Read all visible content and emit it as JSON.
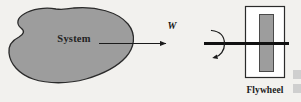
{
  "figure": {
    "kind": "engineering-diagram",
    "background_color": "#f2f1ee",
    "ink_color": "#1b1b1b"
  },
  "system": {
    "label": "System",
    "shape": "irregular-blob",
    "fill_color": "#9d9d9d",
    "stroke_color": "#2b2b2b"
  },
  "work_arrow": {
    "label": "W",
    "meaning": "work transfer",
    "direction": "left-to-right",
    "color": "#1b1b1b"
  },
  "shaft": {
    "label": "",
    "color": "#111111",
    "description": "thick rotating shaft"
  },
  "rotation": {
    "label": "",
    "direction": "clockwise",
    "color": "#1b1b1b",
    "description": "curved rotation arrow around shaft"
  },
  "flywheel": {
    "label": "Flywheel",
    "outer_fill": "#ffffff",
    "outer_stroke": "#2b2b2b",
    "inner_fill": "#9d9d9d",
    "inner_stroke": "#4a4a4a"
  },
  "artifacts": {
    "note": "scan edge blocks",
    "color": "#c9c9c9"
  }
}
